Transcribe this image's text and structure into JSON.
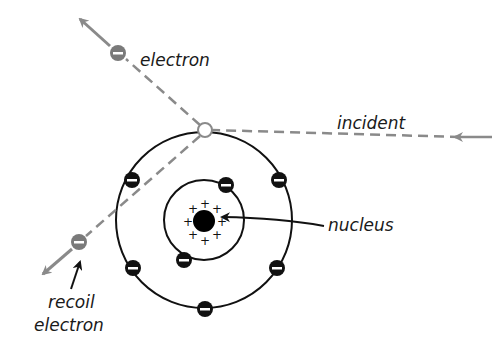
{
  "diagram": {
    "labels": {
      "electron": "electron",
      "incident": "incident",
      "nucleus": "nucleus",
      "recoil_line1": "recoil",
      "recoil_line2": "electron"
    },
    "colors": {
      "ray": "#8a8a8a",
      "orbit": "#111111",
      "bound_electron": "#111111",
      "free_electron": "#7a7a7a",
      "nucleus": "#000000",
      "text": "#1a1a1a"
    },
    "symbols": {
      "negative": "−",
      "positive": "+"
    },
    "orbits": {
      "inner_electron_count": 2,
      "outer_electron_count": 6
    }
  }
}
